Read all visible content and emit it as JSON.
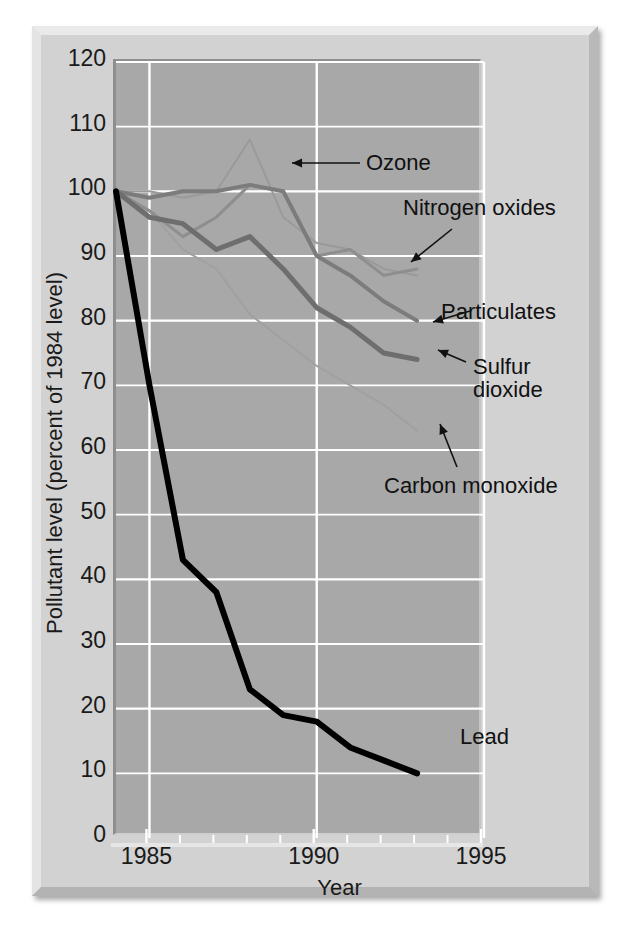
{
  "figure": {
    "kind": "line-chart-figure",
    "frame_color": "#d2d2d2",
    "plot_bg_color": "#a8a8a8",
    "gridline_color": "#ffffff"
  },
  "axes": {
    "y_title": "Pollutant level (percent of 1984 level)",
    "x_title": "Year",
    "y_ticks": [
      "0",
      "10",
      "20",
      "30",
      "40",
      "50",
      "60",
      "70",
      "80",
      "90",
      "100",
      "110",
      "120"
    ],
    "x_ticks": [
      "1985",
      "1990",
      "1995"
    ]
  },
  "annotations": {
    "ozone": "Ozone",
    "nitrogen_oxides": "Nitrogen oxides",
    "particulates": "Particulates",
    "sulfur_dioxide_line1": "Sulfur",
    "sulfur_dioxide_line2": "dioxide",
    "carbon_monoxide": "Carbon monoxide",
    "lead": "Lead"
  },
  "chart_data": {
    "type": "line",
    "title": "",
    "subtitle": "",
    "xlabel": "Year",
    "ylabel": "Pollutant level (percent of 1984 level)",
    "xlim": [
      1984,
      1995
    ],
    "ylim": [
      0,
      120
    ],
    "x_major_ticks": [
      1985,
      1990,
      1995
    ],
    "x_minor_ticks": [
      1986,
      1987,
      1988,
      1989,
      1991,
      1992,
      1993,
      1994
    ],
    "y_ticks": [
      0,
      10,
      20,
      30,
      40,
      50,
      60,
      70,
      80,
      90,
      100,
      110,
      120
    ],
    "grid": "both-axes-white-gridlines",
    "legend": "inline-annotations-with-arrows",
    "x": [
      1984,
      1985,
      1986,
      1987,
      1988,
      1989,
      1990,
      1991,
      1992,
      1993
    ],
    "series": [
      {
        "name": "Ozone",
        "color": "#9a9a9a",
        "width": 2,
        "values": [
          100,
          100,
          99,
          100,
          108,
          96,
          92,
          91,
          88,
          87
        ]
      },
      {
        "name": "Nitrogen oxides",
        "color": "#8e8e8e",
        "width": 3,
        "values": [
          100,
          97,
          93,
          96,
          101,
          100,
          90,
          91,
          87,
          88
        ]
      },
      {
        "name": "Particulates",
        "color": "#7c7c7c",
        "width": 4,
        "values": [
          100,
          99,
          100,
          100,
          101,
          100,
          90,
          87,
          83,
          80
        ]
      },
      {
        "name": "Sulfur dioxide",
        "color": "#6e6e6e",
        "width": 5,
        "values": [
          100,
          96,
          95,
          91,
          93,
          88,
          82,
          79,
          75,
          74
        ]
      },
      {
        "name": "Carbon monoxide",
        "color": "#a0a0a0",
        "width": 2,
        "values": [
          100,
          97,
          91,
          88,
          81,
          77,
          73,
          70,
          67,
          63
        ]
      },
      {
        "name": "Lead",
        "color": "#000000",
        "width": 6,
        "values": [
          100,
          70,
          43,
          38,
          23,
          19,
          18,
          14,
          12,
          10
        ]
      }
    ]
  }
}
